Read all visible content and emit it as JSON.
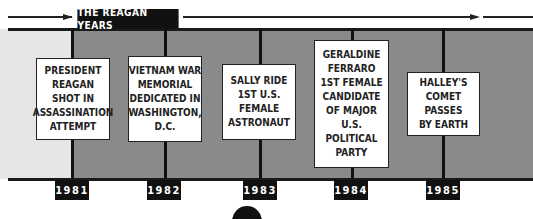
{
  "title": "THE REAGAN YEARS",
  "colors": {
    "band_before": "#e6e6e6",
    "band_main": "#8a8a8a",
    "line": "#1a1a1a",
    "label_bg": "#111111",
    "label_text": "#ffffff"
  },
  "events": [
    {
      "year": "1981",
      "text": "PRESIDENT\nREAGAN\nSHOT IN\nASSASSINATION\nATTEMPT"
    },
    {
      "year": "1982",
      "text": "VIETNAM WAR\nMEMORIAL\nDEDICATED IN\nWASHINGTON,\nD.C."
    },
    {
      "year": "1983",
      "text": "SALLY RIDE\n1ST U.S.\nFEMALE\nASTRONAUT"
    },
    {
      "year": "1984",
      "text": "GERALDINE\nFERRARO\n1ST FEMALE\nCANDIDATE\nOF MAJOR U.S.\nPOLITICAL\nPARTY"
    },
    {
      "year": "1985",
      "text": "HALLEY'S COMET\nPASSES\nBY EARTH"
    }
  ]
}
